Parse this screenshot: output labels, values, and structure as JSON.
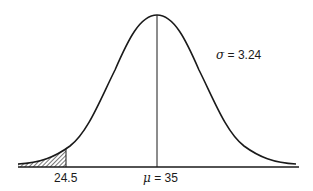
{
  "diagram": {
    "type": "normal-distribution-curve",
    "annotation": {
      "symbol": "σ",
      "text": " = 3.24"
    },
    "mean_label": {
      "symbol": "μ",
      "text": " = 35"
    },
    "cutoff_label": "24.5",
    "mean": 35,
    "sigma": 3.24,
    "cutoff": 24.5,
    "shaded_region": "left tail below 24.5",
    "colors": {
      "line": "#1a1a1a",
      "background": "#ffffff"
    }
  }
}
